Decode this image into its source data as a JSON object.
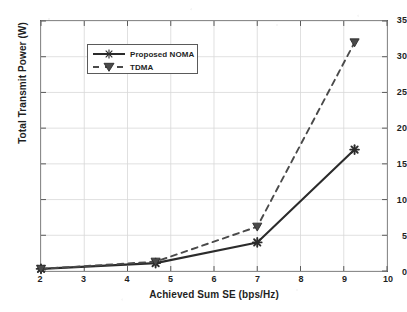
{
  "chart_data": {
    "type": "line",
    "title": "",
    "xlabel": "Achieved Sum SE (bps/Hz)",
    "ylabel": "Total Transmit Power (W)",
    "xlim": [
      2,
      10
    ],
    "ylim": [
      0,
      35
    ],
    "xticks": [
      2,
      3,
      4,
      5,
      6,
      7,
      8,
      9,
      10
    ],
    "yticks": [
      0,
      5,
      10,
      15,
      20,
      25,
      30,
      35
    ],
    "xtick_labels": [
      "2",
      "3",
      "4",
      "5",
      "6",
      "7",
      "8",
      "9",
      "10"
    ],
    "ytick_labels": [
      "0",
      "5",
      "10",
      "15",
      "20",
      "25",
      "30",
      "35"
    ],
    "grid": true,
    "legend_position": "upper left",
    "series": [
      {
        "name": "Proposed NOMA",
        "style": "solid",
        "marker": "star",
        "color": "#2b2b2b",
        "x": [
          2.0,
          4.65,
          7.0,
          9.25
        ],
        "y": [
          0.3,
          1.1,
          4.0,
          17.0
        ]
      },
      {
        "name": "TDMA",
        "style": "dashed",
        "marker": "triangle-down",
        "color": "#4a4a4a",
        "x": [
          2.0,
          4.65,
          7.0,
          9.25
        ],
        "y": [
          0.3,
          1.3,
          6.2,
          32.0
        ]
      }
    ]
  },
  "legend": {
    "items": [
      {
        "label": "Proposed NOMA"
      },
      {
        "label": "TDMA"
      }
    ]
  },
  "colors": {
    "series_noma": "#2b2b2b",
    "series_tdma": "#4a4a4a",
    "axis": "#5a5a5a",
    "grid": "#d8d8d8",
    "text": "#1f1f1f",
    "background": "#ffffff"
  }
}
